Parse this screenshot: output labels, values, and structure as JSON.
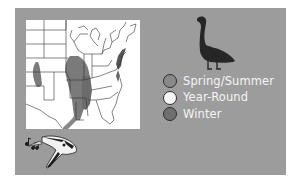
{
  "figure": {
    "background_color": "#ffffff",
    "panel_color": "#9c9c9c",
    "map": {
      "region": "eastern-united-states",
      "range_color": "#7a7a7a",
      "land_color": "#ffffff",
      "border_color": "#333333"
    },
    "illustrations": {
      "top_right": "goose-silhouette-icon",
      "bottom_left": "singing-bird-icon"
    },
    "legend": {
      "items": [
        {
          "label": "Spring/Summer",
          "fill": "#8a8a8a"
        },
        {
          "label": "Year-Round",
          "fill": "#f6f6f6"
        },
        {
          "label": "Winter",
          "fill": "#6f6f6f"
        }
      ]
    }
  }
}
